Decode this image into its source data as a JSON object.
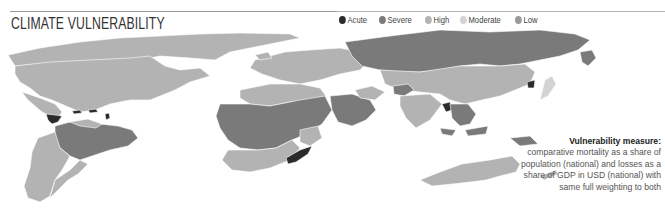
{
  "title": "CLIMATE VULNERABILITY",
  "legend": {
    "items": [
      {
        "label": "Acute",
        "color": "#2b2b2b"
      },
      {
        "label": "Severe",
        "color": "#7a7a7a"
      },
      {
        "label": "High",
        "color": "#b3b3b3"
      },
      {
        "label": "Moderate",
        "color": "#d3d3d3"
      },
      {
        "label": "Low",
        "color": "#9a9a9a"
      }
    ]
  },
  "note": {
    "heading": "Vulnerability measure:",
    "body": "comparative mortality as a share of population (national) and losses as a share of GDP in USD (national) with same full weighting to both"
  },
  "map": {
    "regions": [
      {
        "name": "North America",
        "level": "High"
      },
      {
        "name": "Greenland",
        "level": "High"
      },
      {
        "name": "Central America / Caribbean",
        "level": "Acute"
      },
      {
        "name": "South America (north / Brazil)",
        "level": "Severe"
      },
      {
        "name": "South America (south)",
        "level": "High"
      },
      {
        "name": "Europe",
        "level": "High"
      },
      {
        "name": "Russia",
        "level": "Severe"
      },
      {
        "name": "Central Asia / China",
        "level": "High"
      },
      {
        "name": "North Korea",
        "level": "Acute"
      },
      {
        "name": "Africa (central)",
        "level": "Severe"
      },
      {
        "name": "Africa (north / south)",
        "level": "High"
      },
      {
        "name": "Madagascar",
        "level": "Acute"
      },
      {
        "name": "Middle East / Arabia",
        "level": "Severe"
      },
      {
        "name": "India",
        "level": "High"
      },
      {
        "name": "Southeast Asia",
        "level": "Severe"
      },
      {
        "name": "Myanmar",
        "level": "Acute"
      },
      {
        "name": "Indonesia / PNG",
        "level": "Severe"
      },
      {
        "name": "Australia",
        "level": "High"
      }
    ]
  }
}
